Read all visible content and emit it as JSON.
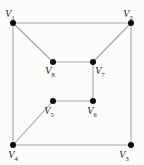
{
  "diagram": {
    "type": "undirected-graph",
    "background": "#fcfcfa",
    "edge_color": "#a3a3a3",
    "edge_width": 1.1,
    "vertex_color": "#0c0c0c",
    "vertex_radius": 3,
    "label_color": "#1a1a1a",
    "vertices": [
      {
        "id": "V1",
        "letter": "V",
        "sub": "1",
        "x": 13,
        "y": 23,
        "lx": 10,
        "ly": 17
      },
      {
        "id": "V2",
        "letter": "V",
        "sub": "2",
        "x": 131,
        "y": 23,
        "lx": 128,
        "ly": 17
      },
      {
        "id": "V3",
        "letter": "V",
        "sub": "3",
        "x": 131,
        "y": 145,
        "lx": 124,
        "ly": 158
      },
      {
        "id": "V4",
        "letter": "V",
        "sub": "4",
        "x": 13,
        "y": 145,
        "lx": 13,
        "ly": 158
      },
      {
        "id": "V5",
        "letter": "V",
        "sub": "5",
        "x": 53,
        "y": 101,
        "lx": 49,
        "ly": 114
      },
      {
        "id": "V6",
        "letter": "V",
        "sub": "6",
        "x": 93,
        "y": 101,
        "lx": 92,
        "ly": 114
      },
      {
        "id": "V7",
        "letter": "V",
        "sub": "7",
        "x": 93,
        "y": 62,
        "lx": 100,
        "ly": 74
      },
      {
        "id": "V8",
        "letter": "V",
        "sub": "8",
        "x": 53,
        "y": 62,
        "lx": 50,
        "ly": 74
      }
    ],
    "edges": [
      [
        "V1",
        "V2"
      ],
      [
        "V2",
        "V3"
      ],
      [
        "V3",
        "V4"
      ],
      [
        "V4",
        "V1"
      ],
      [
        "V1",
        "V8"
      ],
      [
        "V2",
        "V7"
      ],
      [
        "V8",
        "V7"
      ],
      [
        "V7",
        "V6"
      ],
      [
        "V6",
        "V5"
      ],
      [
        "V5",
        "V4"
      ]
    ]
  }
}
